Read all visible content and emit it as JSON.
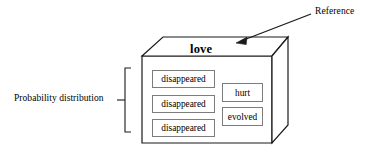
{
  "figure": {
    "type": "diagram"
  },
  "annotations": {
    "reference": {
      "label": "Reference",
      "arrow": "arrow-pointing-to-reference-word"
    },
    "probability_distribution": {
      "label": "Probability distribution",
      "bracket": "vertical-bracket-spanning-candidate-cells"
    }
  },
  "box": {
    "reference_word": "love",
    "columns": [
      {
        "name": "left-column",
        "cells": [
          {
            "label": "disappeared"
          },
          {
            "label": "disappeared"
          },
          {
            "label": "disappeared"
          }
        ]
      },
      {
        "name": "right-column",
        "cells": [
          {
            "label": "hurt"
          },
          {
            "label": "evolved"
          }
        ]
      }
    ]
  },
  "colors": {
    "stroke": "#1a1a1a",
    "cell_border": "#7c7c7c",
    "background": "#ffffff",
    "text": "#000000"
  }
}
